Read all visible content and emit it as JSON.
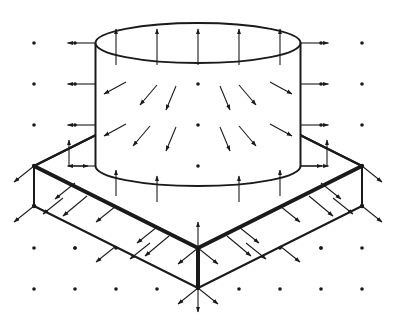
{
  "colors": {
    "ink": "#1a1a1a",
    "background": "#ffffff"
  },
  "grid": {
    "xs": [
      34,
      75,
      116,
      157,
      198,
      239,
      280,
      321,
      362
    ],
    "ys": [
      43,
      84,
      125,
      166,
      207,
      248
    ],
    "dot_radius": 1.8
  },
  "cylinder": {
    "cx": 198,
    "top_y": 43,
    "bottom_y": 166,
    "rx": 102.5,
    "ry": 20
  },
  "slab": {
    "back": [
      198,
      84
    ],
    "left": [
      34,
      166
    ],
    "front": [
      198,
      248
    ],
    "right": [
      362,
      166
    ],
    "thickness": 40
  },
  "arrows": {
    "top_up": [
      [
        116,
        43
      ],
      [
        157,
        43
      ],
      [
        198,
        43
      ],
      [
        239,
        43
      ],
      [
        280,
        43
      ]
    ],
    "side_left": [
      [
        96,
        43
      ],
      [
        96,
        84
      ],
      [
        96,
        125
      ],
      [
        96,
        166
      ]
    ],
    "side_right": [
      [
        301,
        43
      ],
      [
        301,
        84
      ],
      [
        301,
        125
      ],
      [
        301,
        166
      ]
    ],
    "inner_field": [
      {
        "x": 126,
        "y": 82,
        "dx": -22,
        "dy": 12
      },
      {
        "x": 157,
        "y": 85,
        "dx": -17,
        "dy": 20
      },
      {
        "x": 176,
        "y": 86,
        "dx": -10,
        "dy": 24
      },
      {
        "x": 220,
        "y": 86,
        "dx": 10,
        "dy": 24
      },
      {
        "x": 239,
        "y": 85,
        "dx": 17,
        "dy": 20
      },
      {
        "x": 270,
        "y": 82,
        "dx": 22,
        "dy": 12
      },
      {
        "x": 126,
        "y": 124,
        "dx": -22,
        "dy": 12
      },
      {
        "x": 150,
        "y": 126,
        "dx": -17,
        "dy": 20
      },
      {
        "x": 176,
        "y": 127,
        "dx": -10,
        "dy": 24
      },
      {
        "x": 220,
        "y": 127,
        "dx": 10,
        "dy": 24
      },
      {
        "x": 239,
        "y": 126,
        "dx": 17,
        "dy": 20
      },
      {
        "x": 270,
        "y": 124,
        "dx": 22,
        "dy": 12
      }
    ],
    "slab_top_up": [
      [
        116,
        176
      ],
      [
        157,
        186
      ],
      [
        239,
        186
      ],
      [
        280,
        176
      ]
    ],
    "slab_normals_left": [
      [
        34,
        166
      ],
      [
        34,
        206
      ],
      [
        75,
        216
      ],
      [
        116,
        186
      ],
      [
        116,
        236
      ],
      [
        157,
        256
      ],
      [
        198,
        248
      ],
      [
        198,
        288
      ]
    ],
    "slab_normals_right": [
      [
        362,
        166
      ],
      [
        362,
        206
      ],
      [
        321,
        216
      ],
      [
        280,
        186
      ],
      [
        280,
        236
      ],
      [
        239,
        256
      ],
      [
        198,
        248
      ],
      [
        198,
        288
      ]
    ],
    "vertical_front": [
      [
        198,
        248
      ],
      [
        198,
        288
      ]
    ]
  },
  "labels": {
    "cylinder": "cylinder",
    "slab": "square slab",
    "field": "vector field arrows",
    "grid": "dot grid"
  }
}
